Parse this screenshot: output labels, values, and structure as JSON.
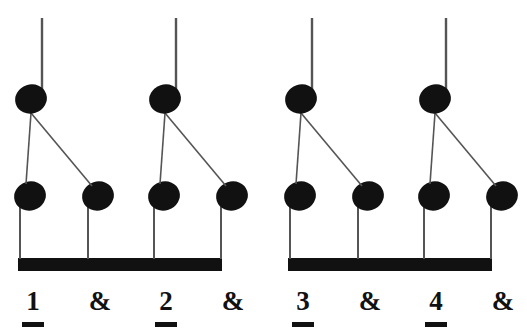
{
  "figure": {
    "kind": "rhythm-notation",
    "ink_color": "#111111",
    "stem_color": "#555555",
    "background_color": "#ffffff"
  },
  "groups": [
    {
      "name": "group-1",
      "beam": {
        "x": 18,
        "y": 258,
        "width": 204,
        "height": 13
      },
      "upper_notes": [
        {
          "name": "upper-note-1",
          "head_cx": 31,
          "head_cy": 99,
          "stem_x": 42,
          "stem_top": 18
        },
        {
          "name": "upper-note-2",
          "head_cx": 165,
          "head_cy": 99,
          "stem_x": 176,
          "stem_top": 18
        }
      ],
      "lower_notes": [
        {
          "name": "lower-note-1",
          "head_cx": 30,
          "head_cy": 196,
          "stem_x": 20
        },
        {
          "name": "lower-note-2",
          "head_cx": 98,
          "head_cy": 196,
          "stem_x": 88
        },
        {
          "name": "lower-note-3",
          "head_cx": 164,
          "head_cy": 196,
          "stem_x": 154
        },
        {
          "name": "lower-note-4",
          "head_cx": 232,
          "head_cy": 196,
          "stem_x": 221
        }
      ],
      "connectors": [
        {
          "name": "connector-straight-1",
          "x1": 31,
          "y1": 113,
          "x2": 26,
          "y2": 184
        },
        {
          "name": "connector-diagonal-1",
          "x1": 31,
          "y1": 113,
          "x2": 92,
          "y2": 186
        },
        {
          "name": "connector-straight-2",
          "x1": 165,
          "y1": 113,
          "x2": 160,
          "y2": 184
        },
        {
          "name": "connector-diagonal-2",
          "x1": 165,
          "y1": 113,
          "x2": 226,
          "y2": 186
        }
      ]
    },
    {
      "name": "group-2",
      "beam": {
        "x": 288,
        "y": 258,
        "width": 204,
        "height": 13
      },
      "upper_notes": [
        {
          "name": "upper-note-3",
          "head_cx": 301,
          "head_cy": 99,
          "stem_x": 312,
          "stem_top": 18
        },
        {
          "name": "upper-note-4",
          "head_cx": 435,
          "head_cy": 99,
          "stem_x": 446,
          "stem_top": 18
        }
      ],
      "lower_notes": [
        {
          "name": "lower-note-5",
          "head_cx": 300,
          "head_cy": 196,
          "stem_x": 290
        },
        {
          "name": "lower-note-6",
          "head_cx": 368,
          "head_cy": 196,
          "stem_x": 358
        },
        {
          "name": "lower-note-7",
          "head_cx": 434,
          "head_cy": 196,
          "stem_x": 424
        },
        {
          "name": "lower-note-8",
          "head_cx": 502,
          "head_cy": 196,
          "stem_x": 491
        }
      ],
      "connectors": [
        {
          "name": "connector-straight-3",
          "x1": 301,
          "y1": 113,
          "x2": 296,
          "y2": 184
        },
        {
          "name": "connector-diagonal-3",
          "x1": 301,
          "y1": 113,
          "x2": 362,
          "y2": 186
        },
        {
          "name": "connector-straight-4",
          "x1": 435,
          "y1": 113,
          "x2": 430,
          "y2": 184
        },
        {
          "name": "connector-diagonal-4",
          "x1": 435,
          "y1": 113,
          "x2": 496,
          "y2": 186
        }
      ]
    }
  ],
  "count_labels": [
    {
      "name": "count-label-1",
      "text": "1",
      "underlined": true,
      "cx": 33,
      "top": 288,
      "bar_width": 22
    },
    {
      "name": "count-label-and-1",
      "text": "&",
      "underlined": false,
      "cx": 100,
      "top": 288,
      "bar_width": 0
    },
    {
      "name": "count-label-2",
      "text": "2",
      "underlined": true,
      "cx": 166,
      "top": 288,
      "bar_width": 22
    },
    {
      "name": "count-label-and-2",
      "text": "&",
      "underlined": false,
      "cx": 233,
      "top": 288,
      "bar_width": 0
    },
    {
      "name": "count-label-3",
      "text": "3",
      "underlined": true,
      "cx": 303,
      "top": 288,
      "bar_width": 22
    },
    {
      "name": "count-label-and-3",
      "text": "&",
      "underlined": false,
      "cx": 370,
      "top": 288,
      "bar_width": 0
    },
    {
      "name": "count-label-4",
      "text": "4",
      "underlined": true,
      "cx": 436,
      "top": 288,
      "bar_width": 22
    },
    {
      "name": "count-label-and-4",
      "text": "&",
      "underlined": false,
      "cx": 503,
      "top": 288,
      "bar_width": 0
    }
  ],
  "notehead": {
    "rx": 16,
    "ry": 14.5,
    "rotation_deg": -18
  }
}
